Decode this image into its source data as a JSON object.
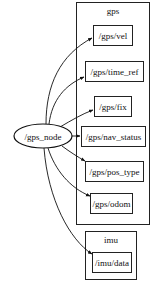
{
  "diagram": {
    "type": "ros_rqt_graph",
    "node": {
      "label": "/gps_node"
    },
    "clusters": [
      {
        "label": "gps",
        "topics": [
          {
            "label": "/gps/vel"
          },
          {
            "label": "/gps/time_ref"
          },
          {
            "label": "/gps/fix"
          },
          {
            "label": "/gps/nav_status"
          },
          {
            "label": "/gps/pos_type"
          },
          {
            "label": "/gps/odom"
          }
        ]
      },
      {
        "label": "imu",
        "topics": [
          {
            "label": "/imu/data"
          }
        ]
      }
    ],
    "edges": [
      {
        "from": "/gps_node",
        "to": "/gps/vel"
      },
      {
        "from": "/gps_node",
        "to": "/gps/time_ref"
      },
      {
        "from": "/gps_node",
        "to": "/gps/fix"
      },
      {
        "from": "/gps_node",
        "to": "/gps/nav_status"
      },
      {
        "from": "/gps_node",
        "to": "/gps/pos_type"
      },
      {
        "from": "/gps_node",
        "to": "/gps/odom"
      },
      {
        "from": "/gps_node",
        "to": "/imu/data"
      }
    ]
  }
}
